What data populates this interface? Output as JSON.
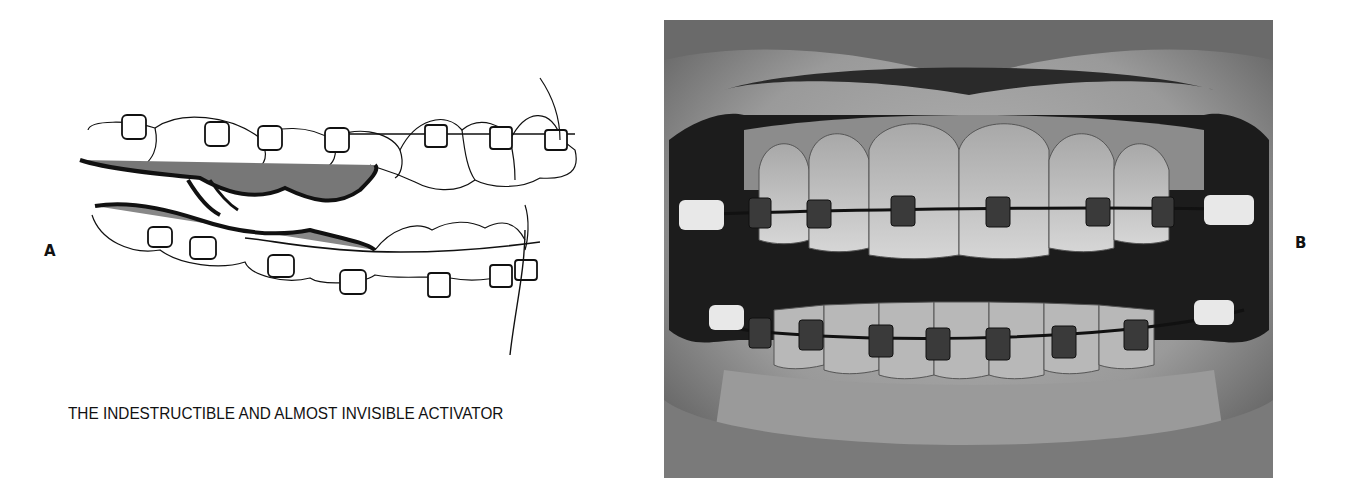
{
  "figure": {
    "panel_a": {
      "label": "A",
      "description": "Line drawing of upper and lower dental arches with orthodontic brackets, archwires, and a connecting acrylic activator",
      "caption": "THE INDESTRUCTIBLE AND ALMOST INVISIBLE ACTIVATOR"
    },
    "panel_b": {
      "label": "B",
      "description": "Black-and-white clinical photograph of front view of teeth with fixed orthodontic brackets and archwires on upper and lower arches"
    }
  },
  "colors": {
    "background": "#ffffff",
    "text": "#111111",
    "photo_dark": "#1a1a1a",
    "photo_mid": "#8a8a8a",
    "photo_light": "#d8d8d8"
  }
}
